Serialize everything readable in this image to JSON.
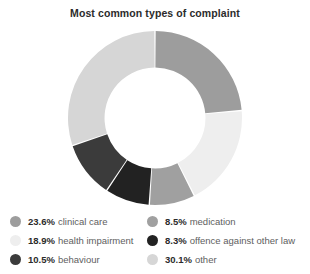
{
  "chart_data": {
    "type": "pie",
    "variant": "donut",
    "title": "Most common types of complaint",
    "xlabel": "",
    "ylabel": "",
    "grid": false,
    "legend_position": "bottom",
    "units": "percent",
    "start_angle_deg": 0,
    "direction": "clockwise",
    "inner_radius_ratio": 0.58,
    "categories": [
      "clinical care",
      "health impairment",
      "medication",
      "offence against other law",
      "behaviour",
      "other"
    ],
    "values": [
      23.6,
      18.9,
      8.5,
      8.3,
      10.5,
      30.1
    ],
    "value_labels": [
      "23.6%",
      "18.9%",
      "8.5%",
      "8.3%",
      "10.5%",
      "30.1%"
    ],
    "colors": [
      "#9d9d9d",
      "#eeeeee",
      "#a0a0a0",
      "#222222",
      "#3b3b3b",
      "#d6d6d6"
    ],
    "slices": [
      {
        "label": "clinical care",
        "value": 23.6,
        "value_label": "23.6%",
        "color": "#9d9d9d"
      },
      {
        "label": "health impairment",
        "value": 18.9,
        "value_label": "18.9%",
        "color": "#eeeeee"
      },
      {
        "label": "medication",
        "value": 8.5,
        "value_label": "8.5%",
        "color": "#a0a0a0"
      },
      {
        "label": "offence against other law",
        "value": 8.3,
        "value_label": "8.3%",
        "color": "#222222"
      },
      {
        "label": "behaviour",
        "value": 10.5,
        "value_label": "10.5%",
        "color": "#3b3b3b"
      },
      {
        "label": "other",
        "value": 30.1,
        "value_label": "30.1%",
        "color": "#d6d6d6"
      }
    ]
  },
  "legend": {
    "left_column": [
      {
        "value_label": "23.6%",
        "label": "clinical care",
        "color": "#9d9d9d"
      },
      {
        "value_label": "18.9%",
        "label": "health impairment",
        "color": "#eeeeee"
      },
      {
        "value_label": "10.5%",
        "label": "behaviour",
        "color": "#3b3b3b"
      }
    ],
    "right_column": [
      {
        "value_label": "8.5%",
        "label": "medication",
        "color": "#a0a0a0"
      },
      {
        "value_label": "8.3%",
        "label": "offence against other law",
        "color": "#222222"
      },
      {
        "value_label": "30.1%",
        "label": "other",
        "color": "#d6d6d6"
      }
    ]
  },
  "style": {
    "background": "#ffffff",
    "title_color": "#2b2b2b",
    "label_color": "#5e5e5e",
    "separator_color": "#ffffff"
  }
}
